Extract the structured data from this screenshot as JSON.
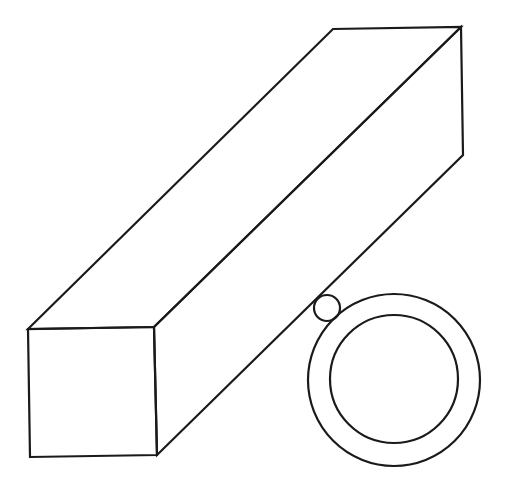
{
  "diagram": {
    "stroke_color": "#1a1a1a",
    "background": "#ffffff",
    "beam": {
      "front_face": [
        [
          28,
          329
        ],
        [
          154,
          327
        ],
        [
          157,
          455
        ],
        [
          30,
          457
        ]
      ],
      "back_top_left": [
        333,
        29
      ],
      "back_top_right": [
        461,
        27
      ],
      "back_bottom_right": [
        463,
        155
      ]
    },
    "small_circle": {
      "cx": 327,
      "cy": 308,
      "r": 13
    },
    "ring": {
      "cx": 394,
      "cy": 380,
      "outer_r": 86,
      "inner_r": 64
    }
  }
}
